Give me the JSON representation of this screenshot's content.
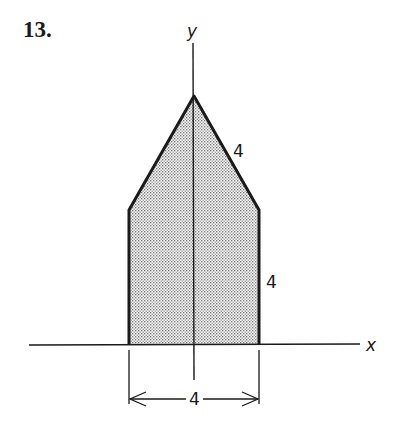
{
  "problem": {
    "number": "13."
  },
  "axes": {
    "x_label": "x",
    "y_label": "y"
  },
  "figure": {
    "shape": "pentagon (house shape) symmetric about the y-axis",
    "dimensions": {
      "slanted_side": "4",
      "vertical_side": "4",
      "base_width": "4"
    }
  },
  "colors": {
    "stroke": "#1a1a1a",
    "fill_dots": "#7a7a7a",
    "background": "#ffffff"
  }
}
